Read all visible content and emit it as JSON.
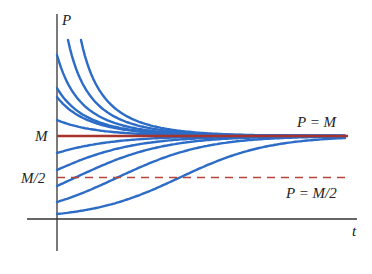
{
  "chart_data": {
    "type": "line",
    "title": "",
    "xlabel": "t",
    "ylabel": "P",
    "grid": false,
    "legend": null,
    "y_ticks": [
      "M",
      "M/2"
    ],
    "annotations": [
      "P = M",
      "P = M/2"
    ],
    "model": "logistic: dP/dt = kP(M - P)",
    "k_per_px": 0.0224,
    "colors": {
      "solution_curves": "#2c6cc6",
      "equilibrium": "#a8322c",
      "half_line": "#b8453a",
      "axes": "#333333"
    },
    "series": [
      {
        "name": "P(0) = 1.98M",
        "p0_over_M": 1.976,
        "t_start_px": 0
      },
      {
        "name": "P(0) = 1.58M",
        "p0_over_M": 1.578,
        "t_start_px": 0
      },
      {
        "name": "P(0) = 1.47M",
        "p0_over_M": 1.47,
        "t_start_px": 0
      },
      {
        "name": "P(0) = 1.19M",
        "p0_over_M": 1.193,
        "t_start_px": 0
      },
      {
        "name": "curve entering from top (1)",
        "p0_over_M": 2.157,
        "t_start_px": 11
      },
      {
        "name": "curve entering from top (2)",
        "p0_over_M": 2.157,
        "t_start_px": 24
      },
      {
        "name": "P(0) = 0.80M",
        "p0_over_M": 0.795,
        "t_start_px": 0
      },
      {
        "name": "P(0) = 0.59M",
        "p0_over_M": 0.59,
        "t_start_px": 0
      },
      {
        "name": "P(0) = 0.40M",
        "p0_over_M": 0.398,
        "t_start_px": 0
      },
      {
        "name": "P(0) = 0.21M",
        "p0_over_M": 0.205,
        "t_start_px": 0
      },
      {
        "name": "P(0) = 0.06M",
        "p0_over_M": 0.06,
        "t_start_px": 0
      }
    ],
    "equilibrium": {
      "label": "P = M",
      "value_over_M": 1.0
    },
    "half_line": {
      "label": "P = M/2",
      "value_over_M": 0.5,
      "style": "dashed"
    }
  },
  "labels": {
    "y_axis": "P",
    "x_axis": "t",
    "tick_M": "M",
    "tick_half": "M/2",
    "line_M": "P = M",
    "line_half": "P = M/2"
  }
}
